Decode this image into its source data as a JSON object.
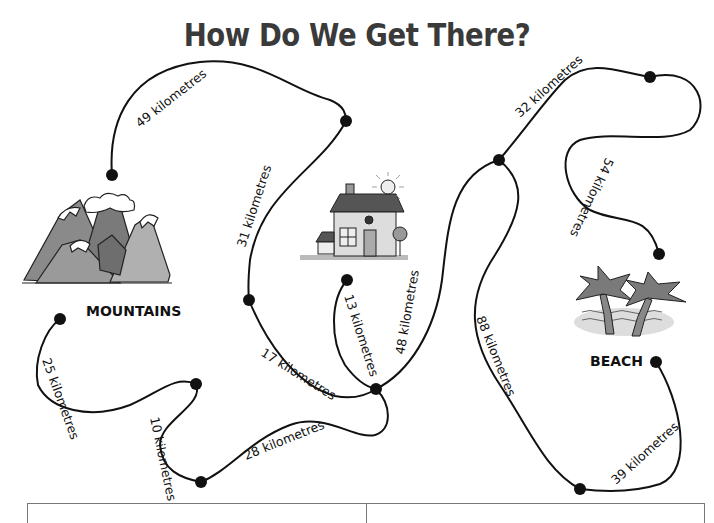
{
  "title": "How Do We Get There?",
  "places": {
    "mountains": "MOUNTAINS",
    "beach": "BEACH",
    "home": ""
  },
  "routes": [
    {
      "id": "r49",
      "label": "49 kilometres",
      "distance_km": 49
    },
    {
      "id": "r31",
      "label": "31 kilometres",
      "distance_km": 31
    },
    {
      "id": "r17",
      "label": "17 kilometres",
      "distance_km": 17
    },
    {
      "id": "r13",
      "label": "13 kilometres",
      "distance_km": 13
    },
    {
      "id": "r48",
      "label": "48 kilometres",
      "distance_km": 48
    },
    {
      "id": "r32",
      "label": "32 kilometres",
      "distance_km": 32
    },
    {
      "id": "r54",
      "label": "54 kilometres",
      "distance_km": 54
    },
    {
      "id": "r88",
      "label": "88 kilometres",
      "distance_km": 88
    },
    {
      "id": "r39",
      "label": "39 kilometres",
      "distance_km": 39
    },
    {
      "id": "r25",
      "label": "25 kilometres",
      "distance_km": 25
    },
    {
      "id": "r10",
      "label": "10 kilometres",
      "distance_km": 10
    },
    {
      "id": "r28",
      "label": "28 kilometres",
      "distance_km": 28
    }
  ],
  "answer_table": {
    "columns": [
      "",
      ""
    ]
  }
}
